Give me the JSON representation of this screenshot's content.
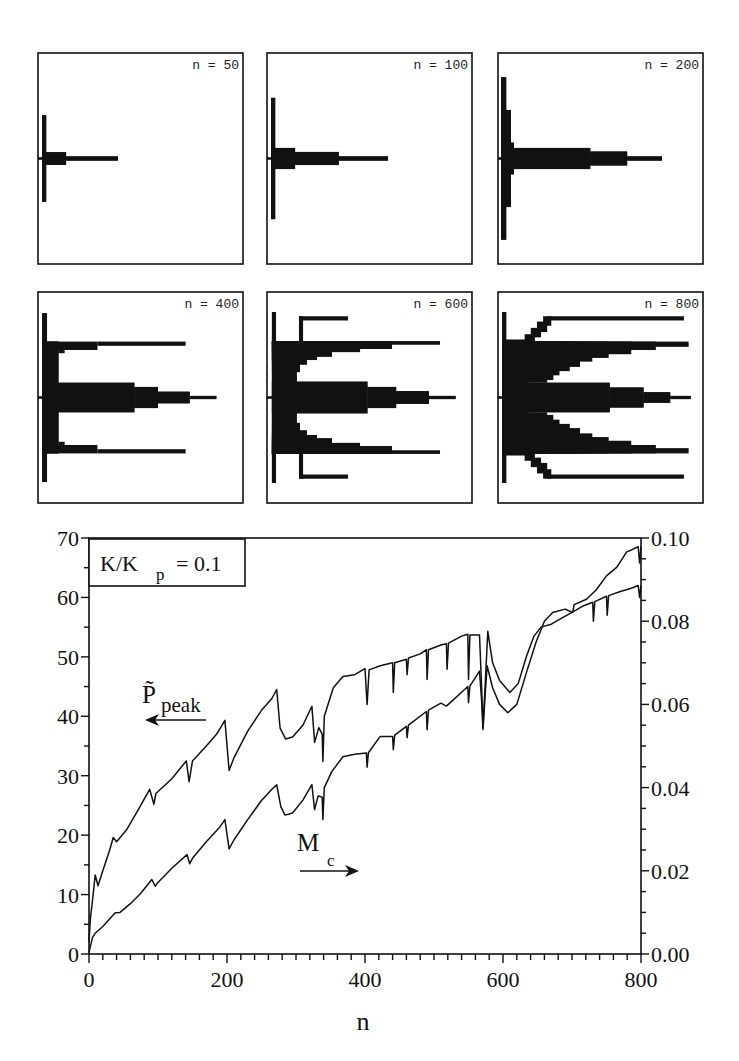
{
  "colors": {
    "ink": "#111111",
    "background": "#ffffff"
  },
  "chart_data": [
    {
      "type": "bar",
      "orientation": "horizontal-histogram",
      "label": "n = 50",
      "rects_note": "[x_start, x_end, y_start, y_end] normalized data units (x 0..1, y -1..1 about centre); mirrored about centre",
      "rects": [
        [
          0.02,
          0.04,
          -0.41,
          0.41
        ],
        [
          0.02,
          0.137,
          -0.06,
          0.06
        ],
        [
          0.137,
          0.39,
          -0.02,
          0.02
        ],
        [
          0.0,
          0.02,
          -0.01,
          0.01
        ]
      ]
    },
    {
      "type": "bar",
      "orientation": "horizontal-histogram",
      "label": "n = 100",
      "rects": [
        [
          0.02,
          0.04,
          -0.575,
          0.575
        ],
        [
          0.02,
          0.137,
          -0.1,
          0.1
        ],
        [
          0.137,
          0.35,
          -0.062,
          0.062
        ],
        [
          0.35,
          0.59,
          -0.02,
          0.02
        ],
        [
          0.0,
          0.02,
          -0.01,
          0.01
        ]
      ]
    },
    {
      "type": "bar",
      "orientation": "horizontal-histogram",
      "label": "n = 200",
      "rects": [
        [
          0.015,
          0.04,
          -0.77,
          0.77
        ],
        [
          0.015,
          0.063,
          -0.46,
          0.46
        ],
        [
          0.015,
          0.078,
          -0.15,
          0.15
        ],
        [
          0.015,
          0.45,
          -0.1,
          0.1
        ],
        [
          0.45,
          0.63,
          -0.066,
          0.066
        ],
        [
          0.63,
          0.8,
          -0.02,
          0.02
        ],
        [
          0.0,
          0.015,
          -0.01,
          0.01
        ]
      ]
    },
    {
      "type": "bar",
      "orientation": "horizontal-histogram",
      "label": "n = 400",
      "rects": [
        [
          0.02,
          0.044,
          -0.8,
          0.8
        ],
        [
          0.02,
          0.1,
          -0.53,
          0.53
        ],
        [
          0.02,
          0.29,
          -0.53,
          -0.45
        ],
        [
          0.29,
          0.72,
          -0.53,
          -0.49
        ],
        [
          0.1,
          0.13,
          -0.45,
          -0.42
        ],
        [
          0.02,
          0.47,
          -0.14,
          0.14
        ],
        [
          0.47,
          0.585,
          -0.1,
          0.1
        ],
        [
          0.585,
          0.74,
          -0.055,
          0.055
        ],
        [
          0.74,
          0.87,
          -0.015,
          0.015
        ],
        [
          0.0,
          0.02,
          -0.01,
          0.01
        ]
      ]
    },
    {
      "type": "bar",
      "orientation": "horizontal-histogram",
      "label": "n = 600",
      "rects": [
        [
          0.024,
          0.044,
          -0.81,
          0.81
        ],
        [
          0.156,
          0.176,
          -0.77,
          -0.53
        ],
        [
          0.156,
          0.395,
          -0.77,
          -0.73
        ],
        [
          0.024,
          0.844,
          -0.535,
          -0.5
        ],
        [
          0.024,
          0.61,
          -0.535,
          -0.46
        ],
        [
          0.024,
          0.454,
          -0.535,
          -0.43
        ],
        [
          0.024,
          0.317,
          -0.535,
          -0.385
        ],
        [
          0.024,
          0.244,
          -0.535,
          -0.355
        ],
        [
          0.024,
          0.195,
          -0.535,
          -0.31
        ],
        [
          0.024,
          0.161,
          -0.535,
          -0.24
        ],
        [
          0.024,
          0.146,
          -0.535,
          0.0
        ],
        [
          0.024,
          0.49,
          -0.15,
          0.15
        ],
        [
          0.49,
          0.63,
          -0.1,
          0.1
        ],
        [
          0.63,
          0.79,
          -0.06,
          0.06
        ],
        [
          0.79,
          0.92,
          -0.015,
          0.015
        ],
        [
          0.0,
          0.024,
          -0.01,
          0.01
        ]
      ]
    },
    {
      "type": "bar",
      "orientation": "horizontal-histogram",
      "label": "n = 800",
      "rects": [
        [
          0.02,
          0.04,
          -0.81,
          0.81
        ],
        [
          0.24,
          0.907,
          -0.77,
          -0.73
        ],
        [
          0.22,
          0.26,
          -0.77,
          -0.68
        ],
        [
          0.19,
          0.24,
          -0.72,
          -0.62
        ],
        [
          0.16,
          0.21,
          -0.66,
          -0.57
        ],
        [
          0.13,
          0.18,
          -0.6,
          -0.53
        ],
        [
          0.02,
          0.93,
          -0.53,
          -0.48
        ],
        [
          0.02,
          0.77,
          -0.53,
          -0.45
        ],
        [
          0.02,
          0.65,
          -0.53,
          -0.41
        ],
        [
          0.02,
          0.54,
          -0.53,
          -0.375
        ],
        [
          0.02,
          0.46,
          -0.53,
          -0.34
        ],
        [
          0.02,
          0.4,
          -0.53,
          -0.29
        ],
        [
          0.02,
          0.35,
          -0.53,
          -0.25
        ],
        [
          0.02,
          0.3,
          -0.53,
          -0.21
        ],
        [
          0.02,
          0.27,
          -0.53,
          -0.165
        ],
        [
          0.02,
          0.24,
          -0.53,
          -0.14
        ],
        [
          0.02,
          0.15,
          -0.55,
          0.0
        ],
        [
          0.02,
          0.545,
          -0.14,
          0.14
        ],
        [
          0.545,
          0.71,
          -0.095,
          0.095
        ],
        [
          0.71,
          0.84,
          -0.05,
          0.05
        ],
        [
          0.84,
          0.94,
          -0.015,
          0.015
        ],
        [
          0.0,
          0.02,
          -0.01,
          0.01
        ]
      ]
    },
    {
      "type": "line",
      "title": "",
      "xlabel": "n",
      "xlim": [
        0,
        800
      ],
      "xticks": [
        0,
        200,
        400,
        600,
        800
      ],
      "xtick_labels": [
        "0",
        "200",
        "400",
        "600",
        "800"
      ],
      "xminor_step": 20,
      "ylim_left": [
        0,
        70
      ],
      "yticks_left": [
        0,
        10,
        20,
        30,
        40,
        50,
        60,
        70
      ],
      "ytick_labels_left": [
        "0",
        "10",
        "20",
        "30",
        "40",
        "50",
        "60",
        "70"
      ],
      "yminor_step_left": 5,
      "ylim_right": [
        0.0,
        0.1
      ],
      "yticks_right": [
        0.0,
        0.02,
        0.04,
        0.06,
        0.08,
        0.1
      ],
      "ytick_labels_right": [
        "0.00",
        "0.02",
        "0.04",
        "0.06",
        "0.08",
        "0.10"
      ],
      "yminor_step_right": 0.005,
      "grid": false,
      "legend": "none",
      "annotations": {
        "ratio_box": {
          "main": "K/K",
          "sub": "p",
          "rest": "= 0.1"
        },
        "p_label": {
          "main": "P̃",
          "sub": "peak",
          "arrow": "left"
        },
        "m_label": {
          "main": "M",
          "sub": "c",
          "arrow": "right"
        }
      },
      "series": [
        {
          "name": "P_peak",
          "axis": "left",
          "points": [
            [
              0,
              2
            ],
            [
              2,
              6
            ],
            [
              5,
              9
            ],
            [
              9,
              13.3
            ],
            [
              13,
              11.5
            ],
            [
              20,
              14
            ],
            [
              30,
              17.5
            ],
            [
              35,
              19.6
            ],
            [
              40,
              18.9
            ],
            [
              55,
              21
            ],
            [
              70,
              24
            ],
            [
              88,
              27.7
            ],
            [
              94,
              25.2
            ],
            [
              97,
              27
            ],
            [
              120,
              29.5
            ],
            [
              141,
              32.5
            ],
            [
              145,
              29
            ],
            [
              150,
              32.5
            ],
            [
              170,
              35
            ],
            [
              185,
              37
            ],
            [
              197,
              39.3
            ],
            [
              203,
              30.9
            ],
            [
              210,
              33
            ],
            [
              230,
              37.5
            ],
            [
              250,
              41
            ],
            [
              265,
              43
            ],
            [
              272,
              44.5
            ],
            [
              277,
              38
            ],
            [
              285,
              36.2
            ],
            [
              295,
              36.5
            ],
            [
              310,
              38.5
            ],
            [
              323,
              41.7
            ],
            [
              327,
              35.6
            ],
            [
              333,
              38.1
            ],
            [
              338,
              37
            ],
            [
              339,
              32.4
            ],
            [
              341,
              40
            ],
            [
              354,
              44.8
            ],
            [
              368,
              46.7
            ],
            [
              385,
              47
            ],
            [
              400,
              48
            ],
            [
              403,
              42
            ],
            [
              406,
              47.8
            ],
            [
              422,
              48.5
            ],
            [
              440,
              49
            ],
            [
              441,
              44
            ],
            [
              443,
              49
            ],
            [
              460,
              49.6
            ],
            [
              461,
              47
            ],
            [
              463,
              49.8
            ],
            [
              480,
              50.5
            ],
            [
              489,
              51.2
            ],
            [
              490,
              46.2
            ],
            [
              492,
              51.2
            ],
            [
              510,
              52
            ],
            [
              518,
              52.2
            ],
            [
              519,
              47.9
            ],
            [
              521,
              52.3
            ],
            [
              540,
              53.5
            ],
            [
              549,
              53.8
            ],
            [
              550,
              46.2
            ],
            [
              552,
              53.7
            ],
            [
              566,
              53.7
            ],
            [
              569,
              45
            ],
            [
              571,
              38.1
            ],
            [
              574,
              45
            ],
            [
              578,
              54.3
            ],
            [
              585,
              49
            ],
            [
              595,
              46
            ],
            [
              610,
              44
            ],
            [
              622,
              45.5
            ],
            [
              634,
              50.1
            ],
            [
              645,
              53.5
            ],
            [
              655,
              55
            ],
            [
              670,
              55.5
            ],
            [
              685,
              56.5
            ],
            [
              700,
              57.5
            ],
            [
              715,
              58.5
            ],
            [
              730,
              59.2
            ],
            [
              731,
              56
            ],
            [
              733,
              59.3
            ],
            [
              750,
              60.2
            ],
            [
              751,
              57
            ],
            [
              753,
              60.3
            ],
            [
              770,
              61
            ],
            [
              785,
              61.5
            ],
            [
              796,
              62
            ],
            [
              798,
              60
            ],
            [
              800,
              62
            ]
          ]
        },
        {
          "name": "M_c",
          "axis": "right",
          "points": [
            [
              0,
              0.0004
            ],
            [
              5,
              0.004
            ],
            [
              9,
              0.005
            ],
            [
              13,
              0.0056
            ],
            [
              20,
              0.0066
            ],
            [
              38,
              0.0099
            ],
            [
              45,
              0.01
            ],
            [
              60,
              0.0121
            ],
            [
              75,
              0.0146
            ],
            [
              91,
              0.0179
            ],
            [
              96,
              0.0163
            ],
            [
              100,
              0.0172
            ],
            [
              120,
              0.0206
            ],
            [
              142,
              0.0239
            ],
            [
              146,
              0.0217
            ],
            [
              150,
              0.023
            ],
            [
              170,
              0.027
            ],
            [
              190,
              0.0306
            ],
            [
              197,
              0.0323
            ],
            [
              203,
              0.0253
            ],
            [
              210,
              0.0274
            ],
            [
              230,
              0.0323
            ],
            [
              250,
              0.0369
            ],
            [
              265,
              0.0396
            ],
            [
              272,
              0.0407
            ],
            [
              278,
              0.0354
            ],
            [
              284,
              0.0334
            ],
            [
              295,
              0.0339
            ],
            [
              310,
              0.037
            ],
            [
              323,
              0.0407
            ],
            [
              327,
              0.0347
            ],
            [
              332,
              0.038
            ],
            [
              338,
              0.0377
            ],
            [
              339,
              0.0323
            ],
            [
              341,
              0.04
            ],
            [
              352,
              0.0439
            ],
            [
              368,
              0.0474
            ],
            [
              385,
              0.048
            ],
            [
              402,
              0.0483
            ],
            [
              403,
              0.0449
            ],
            [
              405,
              0.0484
            ],
            [
              422,
              0.0523
            ],
            [
              440,
              0.0523
            ],
            [
              441,
              0.0491
            ],
            [
              443,
              0.0526
            ],
            [
              460,
              0.0547
            ],
            [
              461,
              0.052
            ],
            [
              463,
              0.055
            ],
            [
              489,
              0.0583
            ],
            [
              490,
              0.0539
            ],
            [
              492,
              0.0586
            ],
            [
              510,
              0.0603
            ],
            [
              518,
              0.0596
            ],
            [
              540,
              0.0629
            ],
            [
              549,
              0.0643
            ],
            [
              550,
              0.0604
            ],
            [
              552,
              0.0644
            ],
            [
              566,
              0.068
            ],
            [
              569,
              0.061
            ],
            [
              571,
              0.054
            ],
            [
              574,
              0.062
            ],
            [
              577,
              0.0693
            ],
            [
              585,
              0.064
            ],
            [
              595,
              0.06
            ],
            [
              607,
              0.058
            ],
            [
              620,
              0.06
            ],
            [
              634,
              0.0677
            ],
            [
              648,
              0.075
            ],
            [
              660,
              0.08
            ],
            [
              672,
              0.0821
            ],
            [
              690,
              0.0829
            ],
            [
              701,
              0.0821
            ],
            [
              703,
              0.084
            ],
            [
              721,
              0.0853
            ],
            [
              735,
              0.0875
            ],
            [
              750,
              0.0909
            ],
            [
              765,
              0.093
            ],
            [
              779,
              0.0966
            ],
            [
              796,
              0.0979
            ],
            [
              798,
              0.094
            ],
            [
              800,
              0.098
            ]
          ]
        }
      ]
    }
  ]
}
